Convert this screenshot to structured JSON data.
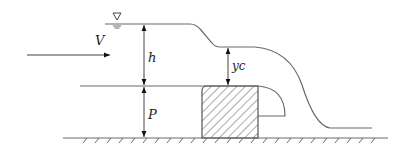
{
  "diagram": {
    "type": "broad-crested weir flow schematic",
    "colors": {
      "line": "#6a6a6a",
      "arrow": "#111111",
      "text": "#222222",
      "background": "#ffffff"
    },
    "labels": {
      "velocity": "V",
      "head": "h",
      "critical_depth": "yc",
      "weir_height": "P"
    },
    "symbols": {
      "water_surface": "∇"
    }
  }
}
